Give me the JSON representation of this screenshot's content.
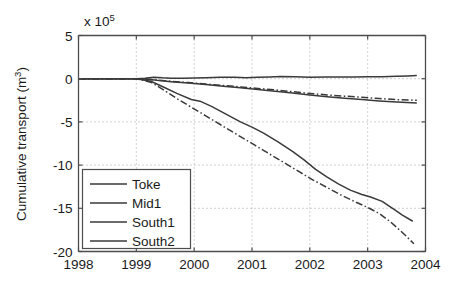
{
  "chart_data": {
    "type": "line",
    "title": "",
    "xlabel": "",
    "ylabel": "Cumulative transport (m",
    "ylabel_sup": "3",
    "ylabel_tail": ")",
    "y_multiplier_text": "x 10",
    "y_multiplier_exp": "5",
    "xlim": [
      1998,
      2004
    ],
    "ylim": [
      -20,
      5
    ],
    "grid": true,
    "grid_style": "dotted",
    "legend_position": "lower-left",
    "xticks": [
      1998,
      1999,
      2000,
      2001,
      2002,
      2003,
      2004
    ],
    "xtick_labels": [
      "1998",
      "1999",
      "2000",
      "2001",
      "2002",
      "2003",
      "2004"
    ],
    "yticks": [
      5,
      0,
      -5,
      -10,
      -15,
      -20
    ],
    "ytick_labels": [
      "5",
      "0",
      "-5",
      "-10",
      "-15",
      "-20"
    ],
    "series": [
      {
        "name": "Toke",
        "style": "solid",
        "color": "#3a3a3a",
        "x": [
          1998.0,
          1998.5,
          1999.0,
          1999.15,
          1999.3,
          1999.45,
          1999.6,
          1999.8,
          2000.0,
          2000.2,
          2000.45,
          2000.7,
          2000.9,
          2001.1,
          2001.3,
          2001.5,
          2001.75,
          2002.0,
          2002.25,
          2002.5,
          2002.75,
          2003.0,
          2003.25,
          2003.5,
          2003.7,
          2003.85
        ],
        "y": [
          0.0,
          0.0,
          0.0,
          0.05,
          0.18,
          0.1,
          0.05,
          0.05,
          0.08,
          0.12,
          0.18,
          0.16,
          0.12,
          0.16,
          0.2,
          0.26,
          0.22,
          0.18,
          0.2,
          0.2,
          0.2,
          0.22,
          0.24,
          0.28,
          0.32,
          0.36
        ]
      },
      {
        "name": "Mid1",
        "style": "dash-dot",
        "color": "#3a3a3a",
        "x": [
          1998.0,
          1998.5,
          1999.0,
          1999.2,
          1999.35,
          1999.6,
          1999.9,
          2000.2,
          2000.5,
          2000.8,
          2001.1,
          2001.4,
          2001.7,
          2002.0,
          2002.3,
          2002.6,
          2002.9,
          2003.2,
          2003.5,
          2003.85
        ],
        "y": [
          0.0,
          0.0,
          0.0,
          -0.05,
          -0.15,
          -0.3,
          -0.45,
          -0.62,
          -0.78,
          -0.95,
          -1.12,
          -1.3,
          -1.5,
          -1.7,
          -1.88,
          -2.02,
          -2.15,
          -2.3,
          -2.42,
          -2.5
        ]
      },
      {
        "name": "South1",
        "style": "solid",
        "color": "#3a3a3a",
        "x": [
          1998.0,
          1998.5,
          1999.0,
          1999.2,
          1999.35,
          1999.6,
          1999.9,
          2000.2,
          2000.5,
          2000.8,
          2001.1,
          2001.4,
          2001.7,
          2002.0,
          2002.3,
          2002.6,
          2002.9,
          2003.2,
          2003.5,
          2003.85
        ],
        "y": [
          0.0,
          0.0,
          0.0,
          -0.06,
          -0.18,
          -0.34,
          -0.5,
          -0.68,
          -0.86,
          -1.05,
          -1.25,
          -1.45,
          -1.66,
          -1.88,
          -2.08,
          -2.26,
          -2.42,
          -2.58,
          -2.7,
          -2.8
        ]
      },
      {
        "name": "South2",
        "style": "solid",
        "color": "#3a3a3a",
        "x": [
          1998.0,
          1998.6,
          1999.0,
          1999.25,
          1999.45,
          1999.7,
          1999.95,
          2000.1,
          2000.3,
          2000.55,
          2000.8,
          2001.0,
          2001.2,
          2001.45,
          2001.7,
          2001.9,
          2002.1,
          2002.3,
          2002.5,
          2002.7,
          2002.9,
          2003.05,
          2003.25,
          2003.45,
          2003.6,
          2003.78
        ],
        "y": [
          0.0,
          0.0,
          0.0,
          -0.3,
          -0.9,
          -1.7,
          -2.4,
          -2.6,
          -3.2,
          -4.1,
          -5.0,
          -5.6,
          -6.3,
          -7.3,
          -8.4,
          -9.4,
          -10.5,
          -11.4,
          -12.2,
          -12.9,
          -13.4,
          -13.7,
          -14.2,
          -15.1,
          -15.8,
          -16.5
        ]
      },
      {
        "name": "South2-alt",
        "style": "dash-dot",
        "color": "#3a3a3a",
        "x": [
          1998.0,
          1998.6,
          1999.0,
          1999.25,
          1999.45,
          1999.7,
          1999.95,
          2000.2,
          2000.5,
          2000.8,
          2001.05,
          2001.3,
          2001.55,
          2001.8,
          2002.05,
          2002.3,
          2002.55,
          2002.8,
          2003.0,
          2003.2,
          2003.4,
          2003.6,
          2003.8
        ],
        "y": [
          0.0,
          0.0,
          0.0,
          -0.4,
          -1.2,
          -2.3,
          -3.3,
          -4.3,
          -5.5,
          -6.7,
          -7.7,
          -8.7,
          -9.7,
          -10.7,
          -11.7,
          -12.6,
          -13.5,
          -14.3,
          -14.9,
          -15.6,
          -16.6,
          -17.8,
          -19.1
        ]
      }
    ]
  },
  "legend": {
    "items": [
      {
        "label": "Toke"
      },
      {
        "label": "Mid1"
      },
      {
        "label": "South1"
      },
      {
        "label": "South2"
      }
    ]
  }
}
